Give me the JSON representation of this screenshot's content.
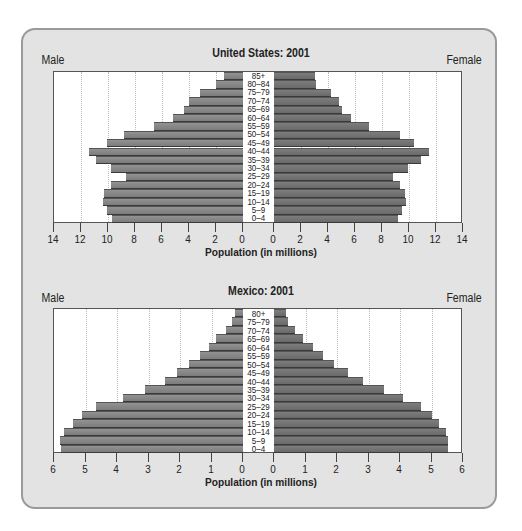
{
  "chart_data": [
    {
      "type": "bar",
      "subtype": "population-pyramid",
      "title": "United States: 2001",
      "left_label": "Male",
      "right_label": "Female",
      "xlabel": "Population (in millions)",
      "ylabel": "",
      "x_ticks_left": [
        "14",
        "12",
        "10",
        "8",
        "6",
        "4",
        "2",
        "0"
      ],
      "x_ticks_right": [
        "0",
        "2",
        "4",
        "6",
        "8",
        "10",
        "12",
        "14"
      ],
      "xlim": [
        0,
        14
      ],
      "grid": true,
      "categories": [
        "85+",
        "80–84",
        "75–79",
        "70–74",
        "65–69",
        "60–64",
        "55–59",
        "50–54",
        "45–49",
        "40–44",
        "35–39",
        "30–34",
        "25–29",
        "20–24",
        "15–19",
        "10–14",
        "5–9",
        "0–4"
      ],
      "series": [
        {
          "name": "Male",
          "values": [
            1.4,
            2.0,
            3.2,
            4.0,
            4.4,
            5.2,
            6.6,
            8.8,
            10.1,
            11.4,
            10.9,
            9.8,
            8.7,
            9.8,
            10.3,
            10.4,
            10.1,
            9.7
          ]
        },
        {
          "name": "Female",
          "values": [
            3.0,
            3.1,
            4.2,
            4.8,
            5.0,
            5.7,
            7.0,
            9.3,
            10.4,
            11.5,
            10.9,
            9.9,
            8.8,
            9.3,
            9.7,
            9.8,
            9.5,
            9.2
          ]
        }
      ]
    },
    {
      "type": "bar",
      "subtype": "population-pyramid",
      "title": "Mexico: 2001",
      "left_label": "Male",
      "right_label": "Female",
      "xlabel": "Population (in millions)",
      "ylabel": "",
      "x_ticks_left": [
        "6",
        "5",
        "4",
        "3",
        "2",
        "1",
        "0"
      ],
      "x_ticks_right": [
        "0",
        "1",
        "2",
        "3",
        "4",
        "5",
        "6"
      ],
      "xlim": [
        0,
        6
      ],
      "grid": true,
      "categories": [
        "80+",
        "75–79",
        "70–74",
        "65–69",
        "60–64",
        "55–59",
        "50–54",
        "45–49",
        "40–44",
        "35–39",
        "30–34",
        "25–29",
        "20–24",
        "15–19",
        "10–14",
        "5–9",
        "0–4"
      ],
      "series": [
        {
          "name": "Male",
          "values": [
            0.25,
            0.35,
            0.55,
            0.85,
            1.08,
            1.37,
            1.71,
            2.1,
            2.48,
            3.12,
            3.81,
            4.67,
            5.11,
            5.4,
            5.69,
            5.81,
            5.77
          ]
        },
        {
          "name": "Female",
          "values": [
            0.39,
            0.44,
            0.66,
            0.93,
            1.24,
            1.56,
            1.9,
            2.35,
            2.81,
            3.49,
            4.1,
            4.67,
            5.0,
            5.24,
            5.46,
            5.51,
            5.51
          ]
        }
      ]
    }
  ],
  "colors": {
    "frame_bg": "#e3e3e3",
    "frame_border": "#9a9a9a",
    "male_bar": "#858585",
    "female_bar": "#707070",
    "bar_edge": "#3a3a3a"
  }
}
